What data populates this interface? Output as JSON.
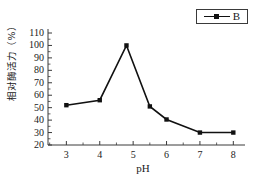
{
  "figure": {
    "background_color": "#ffffff",
    "line_color": "#111111",
    "axis_color": "#3a3a3a",
    "legend": {
      "label": "B",
      "marker": "filled-square-marker"
    }
  },
  "chart_data": {
    "type": "line",
    "title": "",
    "xlabel": "pH",
    "ylabel": "相对酶活力（%）",
    "xlim": [
      2.45,
      8.35
    ],
    "ylim": [
      20,
      110
    ],
    "xticks": [
      3,
      4,
      5,
      6,
      7,
      8
    ],
    "xtick_labels": [
      "3",
      "4",
      "5",
      "6",
      "7",
      "8"
    ],
    "yticks": [
      20,
      30,
      40,
      50,
      60,
      70,
      80,
      90,
      100,
      110
    ],
    "ytick_labels": [
      "20",
      "30",
      "40",
      "50",
      "60",
      "70",
      "80",
      "90",
      "100",
      "110"
    ],
    "xminor_step": 0.25,
    "yminor_step": 5,
    "grid": false,
    "legend_position": "above-right",
    "series": [
      {
        "name": "B",
        "marker": "square",
        "x": [
          3.0,
          4.0,
          4.8,
          5.5,
          6.0,
          7.0,
          8.0
        ],
        "values": [
          52,
          56,
          100,
          51,
          40.5,
          30,
          30
        ]
      }
    ]
  }
}
